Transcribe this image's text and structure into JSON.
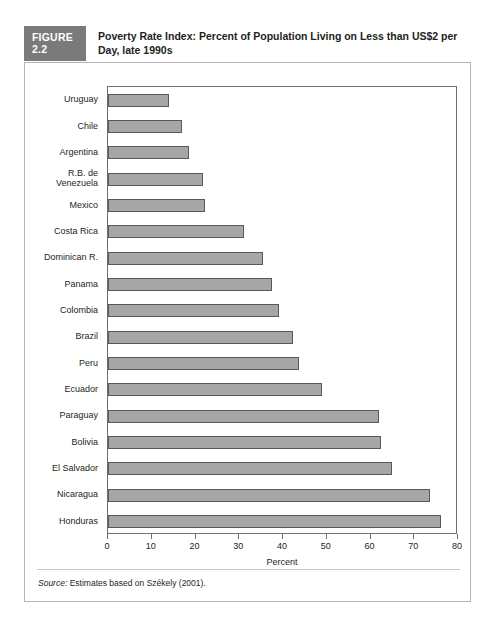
{
  "figure": {
    "tag": "FIGURE 2.2",
    "title": "Poverty Rate Index: Percent of Population Living on Less than US$2 per Day, late 1990s",
    "source_prefix": "Source:",
    "source_text": " Estimates based on Székely (2001)."
  },
  "colors": {
    "tag_background": "#7a7a7a",
    "tag_text": "#ffffff",
    "bar_fill": "#a6a6a6",
    "bar_stroke": "#58595b",
    "frame": "#b4b4b4",
    "axis": "#6f6f6f",
    "text": "#231f20"
  },
  "chart_data": {
    "type": "bar",
    "orientation": "horizontal",
    "title": "Poverty Rate Index: Percent of Population Living on Less than US$2 per Day, late 1990s",
    "xlabel": "Percent",
    "ylabel": "",
    "xlim": [
      0,
      80
    ],
    "xticks": [
      0,
      10,
      20,
      30,
      40,
      50,
      60,
      70,
      80
    ],
    "grid": false,
    "legend": null,
    "categories": [
      "Uruguay",
      "Chile",
      "Argentina",
      "R.B. de\nVenezuela",
      "Mexico",
      "Costa Rica",
      "Dominican R.",
      "Panama",
      "Colombia",
      "Brazil",
      "Peru",
      "Ecuador",
      "Paraguay",
      "Bolivia",
      "El Salvador",
      "Nicaragua",
      "Honduras"
    ],
    "values": [
      14,
      17,
      18.5,
      21.8,
      22.2,
      31,
      35.5,
      37.4,
      39,
      42.3,
      43.7,
      49,
      62,
      62.3,
      65,
      73.5,
      76
    ]
  }
}
